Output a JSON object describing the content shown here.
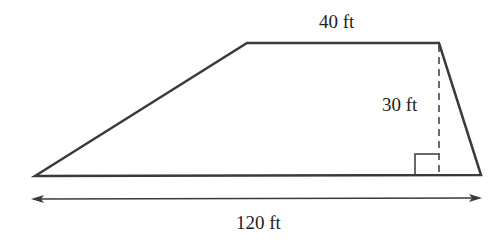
{
  "diagram": {
    "shape": "trapezoid",
    "labels": {
      "top_base": "40 ft",
      "height": "30 ft",
      "bottom_base": "120 ft"
    },
    "colors": {
      "stroke": "#3a3a3a",
      "background": "#ffffff"
    }
  }
}
